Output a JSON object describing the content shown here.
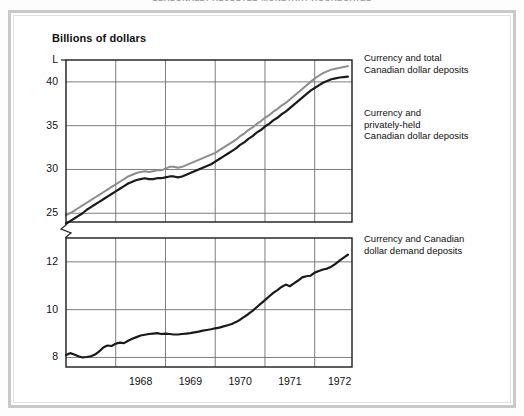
{
  "figure": {
    "cropped_title": "SEASONALLY ADJUSTED MONETARY AGGREGATES",
    "unit_label": "Billions of dollars"
  },
  "legend": {
    "items": [
      {
        "id": "total",
        "label": "Currency and total\nCanadian dollar deposits",
        "color": "#8c8c8c"
      },
      {
        "id": "private",
        "label": "Currency and\nprivately-held\nCanadian dollar deposits",
        "color": "#1a1a1a"
      },
      {
        "id": "demand",
        "label": "Currency and Canadian\ndollar demand deposits",
        "color": "#1a1a1a"
      }
    ]
  },
  "axes": {
    "y_upper_ticks": [
      "L",
      "40",
      "35",
      "30",
      "25"
    ],
    "y_lower_ticks": [
      "12",
      "10",
      "8"
    ],
    "x_ticks": [
      "1968",
      "1969",
      "1970",
      "1971",
      "1972"
    ],
    "break_between": [
      "25",
      "12"
    ]
  },
  "chart_data": {
    "type": "line",
    "title": "SEASONALLY ADJUSTED MONETARY AGGREGATES",
    "xlabel": "",
    "ylabel": "Billions of dollars",
    "grid": true,
    "legend_position": "right",
    "broken_axis": true,
    "upper_panel": {
      "ylim": [
        24.0,
        42.5
      ],
      "yticks": [
        25,
        30,
        35,
        40
      ]
    },
    "lower_panel": {
      "ylim": [
        7.6,
        13.0
      ],
      "yticks": [
        8,
        10,
        12
      ]
    },
    "xlim": [
      1967.0,
      1972.75
    ],
    "x_tick_years": [
      1968,
      1969,
      1970,
      1971,
      1972
    ],
    "x": [
      1967.0,
      1967.083,
      1967.167,
      1967.25,
      1967.333,
      1967.417,
      1967.5,
      1967.583,
      1967.667,
      1967.75,
      1967.833,
      1967.917,
      1968.0,
      1968.083,
      1968.167,
      1968.25,
      1968.333,
      1968.417,
      1968.5,
      1968.583,
      1968.667,
      1968.75,
      1968.833,
      1968.917,
      1969.0,
      1969.083,
      1969.167,
      1969.25,
      1969.333,
      1969.417,
      1969.5,
      1969.583,
      1969.667,
      1969.75,
      1969.833,
      1969.917,
      1970.0,
      1970.083,
      1970.167,
      1970.25,
      1970.333,
      1970.417,
      1970.5,
      1970.583,
      1970.667,
      1970.75,
      1970.833,
      1970.917,
      1971.0,
      1971.083,
      1971.167,
      1971.25,
      1971.333,
      1971.417,
      1971.5,
      1971.583,
      1971.667,
      1971.75,
      1971.833,
      1971.917,
      1972.0,
      1972.083,
      1972.167,
      1972.25,
      1972.333,
      1972.417,
      1972.5,
      1972.583,
      1972.667
    ],
    "series": [
      {
        "name": "Currency and total Canadian dollar deposits",
        "color": "#8c8c8c",
        "panel": "upper",
        "values": [
          24.8,
          25.0,
          25.3,
          25.6,
          25.9,
          26.2,
          26.5,
          26.8,
          27.1,
          27.4,
          27.7,
          28.0,
          28.3,
          28.6,
          28.9,
          29.2,
          29.4,
          29.6,
          29.7,
          29.8,
          29.7,
          29.8,
          29.9,
          29.9,
          30.1,
          30.3,
          30.3,
          30.2,
          30.3,
          30.5,
          30.7,
          30.9,
          31.1,
          31.3,
          31.5,
          31.7,
          31.9,
          32.2,
          32.5,
          32.8,
          33.1,
          33.4,
          33.8,
          34.1,
          34.5,
          34.8,
          35.2,
          35.5,
          35.9,
          36.2,
          36.6,
          36.9,
          37.3,
          37.6,
          38.0,
          38.4,
          38.8,
          39.2,
          39.6,
          40.0,
          40.4,
          40.7,
          41.0,
          41.2,
          41.4,
          41.5,
          41.6,
          41.7,
          41.8
        ]
      },
      {
        "name": "Currency and privately-held Canadian dollar deposits",
        "color": "#1a1a1a",
        "panel": "upper",
        "values": [
          23.8,
          24.1,
          24.4,
          24.7,
          25.0,
          25.4,
          25.7,
          26.0,
          26.3,
          26.6,
          26.9,
          27.2,
          27.5,
          27.8,
          28.1,
          28.4,
          28.6,
          28.8,
          28.9,
          29.0,
          28.9,
          28.9,
          29.0,
          29.0,
          29.1,
          29.2,
          29.2,
          29.1,
          29.2,
          29.4,
          29.6,
          29.8,
          30.0,
          30.2,
          30.4,
          30.6,
          30.9,
          31.2,
          31.5,
          31.8,
          32.1,
          32.4,
          32.8,
          33.1,
          33.5,
          33.8,
          34.2,
          34.5,
          34.9,
          35.2,
          35.6,
          35.9,
          36.3,
          36.6,
          37.0,
          37.4,
          37.8,
          38.2,
          38.6,
          39.0,
          39.3,
          39.6,
          39.9,
          40.1,
          40.3,
          40.4,
          40.5,
          40.55,
          40.6
        ]
      },
      {
        "name": "Currency and Canadian dollar demand deposits",
        "color": "#1a1a1a",
        "panel": "lower",
        "values": [
          8.1,
          8.18,
          8.12,
          8.05,
          8.0,
          8.02,
          8.05,
          8.12,
          8.25,
          8.42,
          8.5,
          8.48,
          8.58,
          8.62,
          8.6,
          8.7,
          8.78,
          8.85,
          8.92,
          8.95,
          8.98,
          9.0,
          9.02,
          8.98,
          9.0,
          8.98,
          8.96,
          8.96,
          8.98,
          9.0,
          9.02,
          9.05,
          9.08,
          9.12,
          9.15,
          9.18,
          9.22,
          9.25,
          9.3,
          9.35,
          9.4,
          9.48,
          9.58,
          9.7,
          9.82,
          9.95,
          10.1,
          10.25,
          10.4,
          10.55,
          10.7,
          10.82,
          10.95,
          11.05,
          10.98,
          11.1,
          11.22,
          11.35,
          11.4,
          11.42,
          11.55,
          11.62,
          11.68,
          11.72,
          11.8,
          11.92,
          12.05,
          12.18,
          12.3
        ]
      }
    ]
  }
}
